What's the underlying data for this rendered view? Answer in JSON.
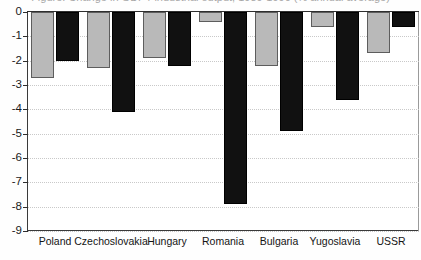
{
  "chart_data": {
    "type": "bar",
    "title": "Figure: Change in GDP / industrial output, 1989-1990 (% annual average)",
    "xlabel": "",
    "ylabel": "",
    "ylim": [
      -9,
      0
    ],
    "grid": true,
    "legend_position": "none",
    "categories": [
      "Poland",
      "Czechoslovakia",
      "Hungary",
      "Romania",
      "Bulgaria",
      "Yugoslavia",
      "USSR"
    ],
    "yticks": [
      "0",
      "-1",
      "-2",
      "-3",
      "-4",
      "-5",
      "-6",
      "-7",
      "-8",
      "-9"
    ],
    "ytick_values": [
      0,
      -1,
      -2,
      -3,
      -4,
      -5,
      -6,
      -7,
      -8,
      -9
    ],
    "series": [
      {
        "name": "Series 1",
        "color": "#b9b9b9",
        "values": [
          -2.7,
          -2.3,
          -1.9,
          -0.4,
          -2.2,
          -0.6,
          -1.7
        ]
      },
      {
        "name": "Series 2",
        "color": "#111111",
        "values": [
          -2.0,
          -4.1,
          -2.2,
          -7.9,
          -4.9,
          -3.6,
          -0.6
        ]
      }
    ]
  }
}
